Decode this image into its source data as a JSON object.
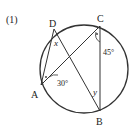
{
  "problem_number": "(1)",
  "points": {
    "A": {
      "label": "A",
      "x": 41,
      "y": 85
    },
    "B": {
      "label": "B",
      "x": 100,
      "y": 111
    },
    "C": {
      "label": "C",
      "x": 100,
      "y": 26
    },
    "D": {
      "label": "D",
      "x": 54,
      "y": 29
    }
  },
  "circle": {
    "cx": 84,
    "cy": 69,
    "r": 44
  },
  "angles": {
    "x": "x",
    "y": "y",
    "angle_A": "30°",
    "angle_C": "45°"
  },
  "colors": {
    "stroke": "#333333",
    "text": "#222222"
  }
}
